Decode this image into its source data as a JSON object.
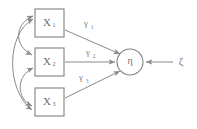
{
  "diagram": {
    "type": "path-diagram",
    "title": "",
    "canvas": {
      "width": 197,
      "height": 129,
      "background": "#ffffff"
    },
    "colors": {
      "stroke": "#808080",
      "edge": "#8a8a8a",
      "text": "#6e6e6e",
      "label": "#7a7a7a",
      "fill": "#ffffff"
    },
    "observed_variables": [
      {
        "id": "x1",
        "label": "X",
        "subscript": "1",
        "shape": "rect",
        "x": 35,
        "y": 9,
        "w": 29,
        "h": 28
      },
      {
        "id": "x2",
        "label": "X",
        "subscript": "2",
        "shape": "rect",
        "x": 35,
        "y": 48,
        "w": 29,
        "h": 28
      },
      {
        "id": "x3",
        "label": "X",
        "subscript": "3",
        "shape": "rect",
        "x": 35,
        "y": 88,
        "w": 29,
        "h": 28
      }
    ],
    "latent_variables": [
      {
        "id": "eta",
        "label": "η",
        "shape": "circle",
        "cx": 130,
        "cy": 62,
        "r": 13
      }
    ],
    "disturbances": [
      {
        "id": "zeta",
        "label": "ζ",
        "x": 181,
        "y": 62
      }
    ],
    "path_labels": [
      {
        "id": "gamma1",
        "label": "γ",
        "subscript": "1",
        "x": 88,
        "y": 24,
        "from": "x1",
        "to": "eta"
      },
      {
        "id": "gamma2",
        "label": "γ",
        "subscript": "2",
        "x": 90,
        "y": 53,
        "from": "x2",
        "to": "eta"
      },
      {
        "id": "gamma3",
        "label": "γ",
        "subscript": "3",
        "x": 83,
        "y": 78,
        "from": "x3",
        "to": "eta"
      }
    ],
    "directed_edges": [
      {
        "id": "edge-x1-eta",
        "from": "x1",
        "to": "eta"
      },
      {
        "id": "edge-x2-eta",
        "from": "x2",
        "to": "eta"
      },
      {
        "id": "edge-x3-eta",
        "from": "x3",
        "to": "eta"
      },
      {
        "id": "edge-zeta-eta",
        "from": "zeta",
        "to": "eta"
      }
    ],
    "covariance_arcs": [
      {
        "id": "arc-x1-x2",
        "from": "x1",
        "to": "x2",
        "double_headed": true
      },
      {
        "id": "arc-x2-x3",
        "from": "x2",
        "to": "x3",
        "double_headed": true
      },
      {
        "id": "arc-x1-x3",
        "from": "x1",
        "to": "x3",
        "double_headed": true
      }
    ]
  }
}
